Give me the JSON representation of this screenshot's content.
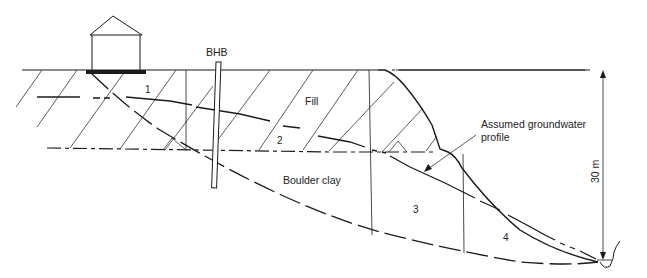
{
  "diagram": {
    "type": "slope-stability-cross-section",
    "labels": {
      "borehole": "BHB",
      "fill": "Fill",
      "boulder_clay": "Boulder clay",
      "groundwater": "Assumed groundwater",
      "groundwater_line2": "profile",
      "height": "30 m"
    },
    "slices": [
      {
        "id": "slice-1",
        "label": "1"
      },
      {
        "id": "slice-2",
        "label": "2"
      },
      {
        "id": "slice-3",
        "label": "3"
      },
      {
        "id": "slice-4",
        "label": "4"
      }
    ],
    "colors": {
      "line": "#1a1a1a",
      "hatch": "#333333",
      "background": "#ffffff"
    }
  }
}
